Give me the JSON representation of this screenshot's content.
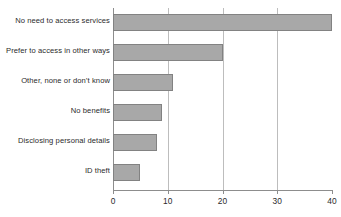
{
  "chart_data": {
    "type": "bar",
    "orientation": "horizontal",
    "title": "",
    "subtitle": "",
    "xlabel": "",
    "ylabel": "",
    "categories": [
      "No need to access services",
      "Prefer to access in other ways",
      "Other, none or don’t know",
      "No benefits",
      "Disclosing personal details",
      "ID theft"
    ],
    "values": [
      40,
      20,
      11,
      9,
      8,
      5
    ],
    "xlim": [
      0,
      40
    ],
    "ylim": null,
    "xticks": [
      "0",
      "10",
      "20",
      "30",
      "40"
    ],
    "xtick_values": [
      0,
      10,
      20,
      30,
      40
    ],
    "grid": "vertical",
    "gridlines_at": [
      10,
      20,
      30
    ],
    "legend": null,
    "legend_position": "none",
    "annotations": [],
    "colors": {
      "bar_fill": "#a8a8a8",
      "bar_stroke": "#828282",
      "gridline": "#bdbdbd",
      "axis": "#8d8d8d",
      "text": "#2b2b2b",
      "background": "#ffffff"
    }
  },
  "axis": {
    "x_tick_labels": [
      "0",
      "10",
      "20",
      "30",
      "40"
    ]
  },
  "series": {
    "bars": [
      {
        "label": "No need to access services",
        "value": 40
      },
      {
        "label": "Prefer to access in other ways",
        "value": 20
      },
      {
        "label": "Other, none or don’t know",
        "value": 11
      },
      {
        "label": "No benefits",
        "value": 9
      },
      {
        "label": "Disclosing personal details",
        "value": 8
      },
      {
        "label": "ID theft",
        "value": 5
      }
    ]
  }
}
